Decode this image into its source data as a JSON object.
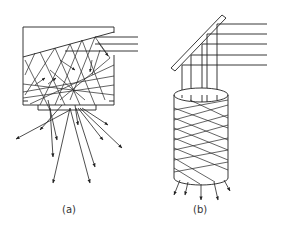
{
  "figure": {
    "panels": [
      {
        "id": "a",
        "label": "(a)",
        "description": "Rectangular light-trapping box with slanted top surface; parallel incident rays enter from right, scatter internally and exit downward through bottom aperture as diverging arrows"
      },
      {
        "id": "b",
        "label": "(b)",
        "description": "Inclined mirror reflecting parallel horizontal rays downward into a cylindrical light pipe; rays zig-zag inside the cylinder and exit at the bottom as arrows"
      }
    ]
  },
  "colors": {
    "stroke": "#222222",
    "background": "#ffffff"
  }
}
